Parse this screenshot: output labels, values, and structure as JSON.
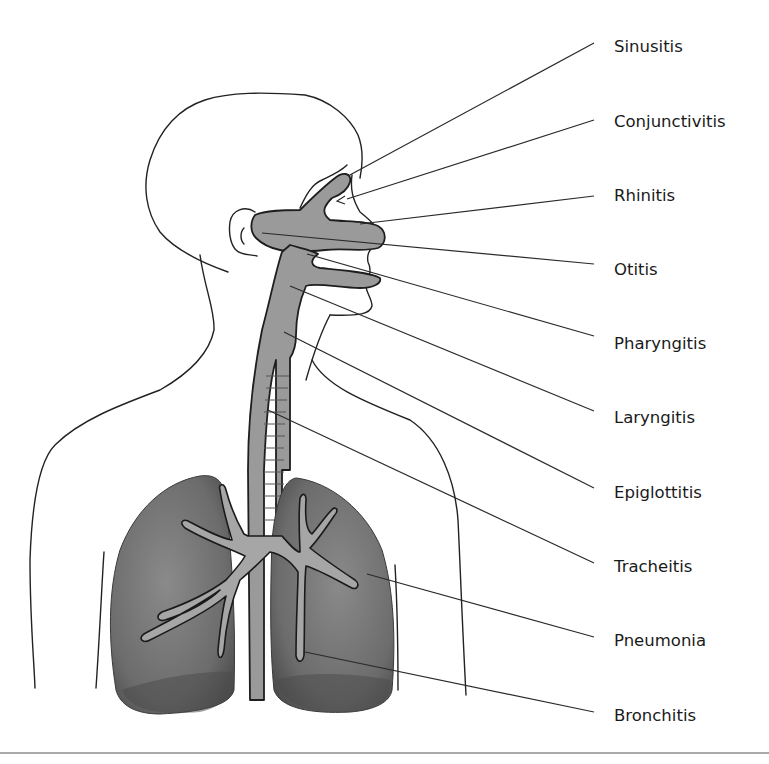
{
  "figure": {
    "colors": {
      "airway_fill": "#9a9a9a",
      "lung_fill": "#6e6e6e",
      "outline": "#222222",
      "rule": "#a9a9a9",
      "background": "#ffffff"
    },
    "labels": [
      {
        "id": "sinusitis",
        "text": "Sinusitis",
        "site": "paranasal sinus"
      },
      {
        "id": "conjunctivitis",
        "text": "Conjunctivitis",
        "site": "eye"
      },
      {
        "id": "rhinitis",
        "text": "Rhinitis",
        "site": "nasal cavity"
      },
      {
        "id": "otitis",
        "text": "Otitis",
        "site": "ear"
      },
      {
        "id": "pharyngitis",
        "text": "Pharyngitis",
        "site": "pharynx"
      },
      {
        "id": "laryngitis",
        "text": "Laryngitis",
        "site": "larynx"
      },
      {
        "id": "epiglottitis",
        "text": "Epiglottitis",
        "site": "epiglottis"
      },
      {
        "id": "tracheitis",
        "text": "Tracheitis",
        "site": "trachea"
      },
      {
        "id": "pneumonia",
        "text": "Pneumonia",
        "site": "lung"
      },
      {
        "id": "bronchitis",
        "text": "Bronchitis",
        "site": "bronchi"
      }
    ]
  }
}
